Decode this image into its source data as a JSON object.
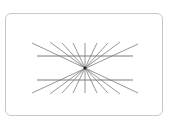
{
  "diagram": {
    "type": "hering-illusion",
    "frame_color": "#c8c8c8",
    "ray_color": "#8a8a8a",
    "horizontal_line_color": "#7a7a7a",
    "center_color": "#222222",
    "center": [
      85,
      68
    ],
    "rays": [
      {
        "x1": 32,
        "y1": 43,
        "x2": 138,
        "y2": 93
      },
      {
        "x1": 50,
        "y1": 42,
        "x2": 120,
        "y2": 94
      },
      {
        "x1": 62,
        "y1": 43,
        "x2": 108,
        "y2": 93
      },
      {
        "x1": 73,
        "y1": 43,
        "x2": 97,
        "y2": 93
      },
      {
        "x1": 85,
        "y1": 43,
        "x2": 85,
        "y2": 93
      },
      {
        "x1": 97,
        "y1": 43,
        "x2": 73,
        "y2": 93
      },
      {
        "x1": 108,
        "y1": 43,
        "x2": 62,
        "y2": 93
      },
      {
        "x1": 120,
        "y1": 42,
        "x2": 50,
        "y2": 94
      },
      {
        "x1": 138,
        "y1": 44,
        "x2": 32,
        "y2": 93
      }
    ],
    "horizontal_lines": [
      {
        "x1": 37,
        "y1": 56,
        "x2": 133,
        "y2": 56
      },
      {
        "x1": 37,
        "y1": 80,
        "x2": 133,
        "y2": 80
      }
    ]
  }
}
